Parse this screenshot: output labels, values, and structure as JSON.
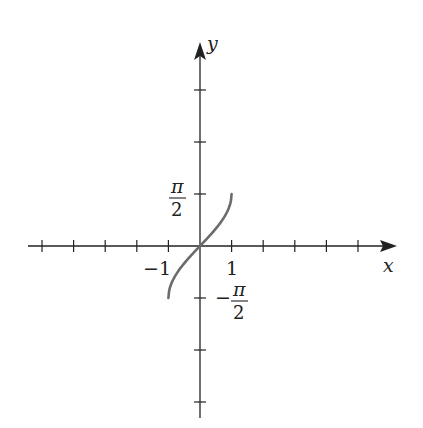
{
  "chart_data": {
    "type": "line",
    "title": "",
    "function": "y = arcsin(x)",
    "xlabel": "x",
    "ylabel": "y",
    "xlim": [
      -5.0,
      6.1
    ],
    "ylim": [
      -3.35,
      3.45
    ],
    "grid": false,
    "legend": null,
    "x_ticks": [
      -5,
      -4,
      -3,
      -2,
      -1,
      1,
      2,
      3,
      4,
      5
    ],
    "y_ticks_in_half_pi": [
      -3,
      -2,
      -1,
      1,
      2,
      3
    ],
    "tick_labels": {
      "x": [
        {
          "value": -1,
          "text": "−1"
        },
        {
          "value": 1,
          "text": "1"
        }
      ],
      "y": [
        {
          "value": 1.5708,
          "text": "π/2"
        },
        {
          "value": -1.5708,
          "text": "−π/2"
        }
      ]
    },
    "series": [
      {
        "name": "arcsin",
        "x": [
          -1,
          -0.95,
          -0.8,
          -0.6,
          -0.4,
          -0.2,
          0,
          0.2,
          0.4,
          0.6,
          0.8,
          0.95,
          1
        ],
        "y": [
          -1.5708,
          -1.2532,
          -0.9273,
          -0.6435,
          -0.4115,
          -0.2014,
          0,
          0.2014,
          0.4115,
          0.6435,
          0.9273,
          1.2532,
          1.5708
        ],
        "color": "#6b6b6b"
      }
    ]
  },
  "labels": {
    "x_axis": "x",
    "y_axis": "y",
    "x_neg_one": "−1",
    "x_pos_one": "1",
    "pi_num": "π",
    "pi_den": "2",
    "neg_sign": "−"
  },
  "colors": {
    "axis": "#222222",
    "curve": "#6b6b6b",
    "background": "#ffffff"
  }
}
